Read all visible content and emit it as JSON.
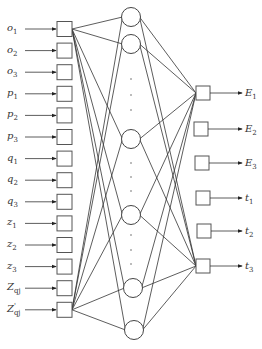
{
  "diagram": {
    "inputs": [
      {
        "base": "o",
        "sub": "1",
        "prime": false
      },
      {
        "base": "o",
        "sub": "2",
        "prime": false
      },
      {
        "base": "o",
        "sub": "3",
        "prime": false
      },
      {
        "base": "p",
        "sub": "1",
        "prime": false
      },
      {
        "base": "p",
        "sub": "2",
        "prime": false
      },
      {
        "base": "p",
        "sub": "3",
        "prime": false
      },
      {
        "base": "q",
        "sub": "1",
        "prime": false
      },
      {
        "base": "q",
        "sub": "2",
        "prime": false
      },
      {
        "base": "q",
        "sub": "3",
        "prime": false
      },
      {
        "base": "z",
        "sub": "1",
        "prime": false
      },
      {
        "base": "z",
        "sub": "2",
        "prime": false
      },
      {
        "base": "z",
        "sub": "3",
        "prime": false
      },
      {
        "base": "Z",
        "sub": "qj",
        "prime": false
      },
      {
        "base": "Z",
        "sub": "qj",
        "prime": true
      }
    ],
    "hidden_count": 6,
    "hidden_ellipsis": "⋮",
    "outputs": [
      {
        "base": "E",
        "sub": "1"
      },
      {
        "base": "E",
        "sub": "2"
      },
      {
        "base": "E",
        "sub": "3"
      },
      {
        "base": "t",
        "sub": "1"
      },
      {
        "base": "t",
        "sub": "2"
      },
      {
        "base": "t",
        "sub": "3"
      }
    ],
    "colors": {
      "stroke": "#333333",
      "background": "#ffffff"
    }
  }
}
